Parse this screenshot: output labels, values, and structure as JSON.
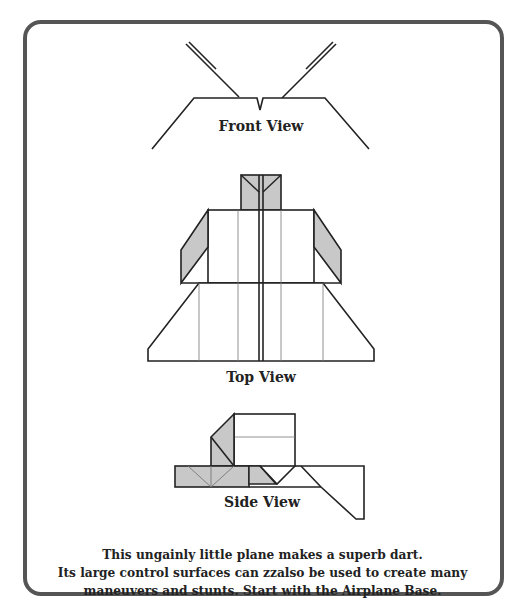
{
  "diagram": {
    "colors": {
      "border": "#555555",
      "line": "#222222",
      "fill_gray": "#c8c8c8",
      "thin_line": "#777777"
    },
    "views": [
      {
        "name": "front",
        "label": "Front View"
      },
      {
        "name": "top",
        "label": "Top View"
      },
      {
        "name": "side",
        "label": "Side View"
      }
    ],
    "caption": {
      "lines": [
        "This ungainly little plane makes a superb dart.",
        "Its large control surfaces can zzalso be used to create many",
        "maneuvers and stunts. Start with the Airplane Base."
      ]
    }
  }
}
